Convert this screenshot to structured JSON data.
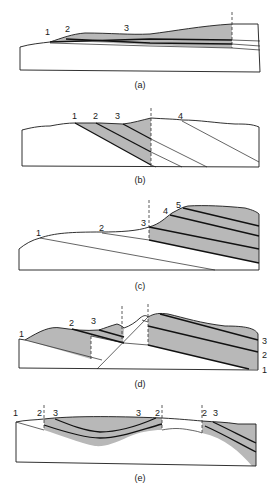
{
  "figure": {
    "panels": [
      {
        "id": "a",
        "caption": "(a)",
        "labels": [
          "1",
          "2",
          "3"
        ]
      },
      {
        "id": "b",
        "caption": "(b)",
        "labels": [
          "1",
          "2",
          "3",
          "4"
        ]
      },
      {
        "id": "c",
        "caption": "(c)",
        "labels": [
          "1",
          "2",
          "3",
          "4",
          "5"
        ]
      },
      {
        "id": "d",
        "caption": "(d)",
        "labels": [
          "1",
          "2",
          "3"
        ],
        "right_labels": [
          "3",
          "2",
          "1"
        ]
      },
      {
        "id": "e",
        "caption": "(e)",
        "labels": [
          "1",
          "2",
          "3",
          "3",
          "2",
          "2",
          "3"
        ]
      }
    ],
    "colors": {
      "shade": "#b8b8b8",
      "line": "#1a1a1a",
      "background": "#ffffff"
    }
  }
}
